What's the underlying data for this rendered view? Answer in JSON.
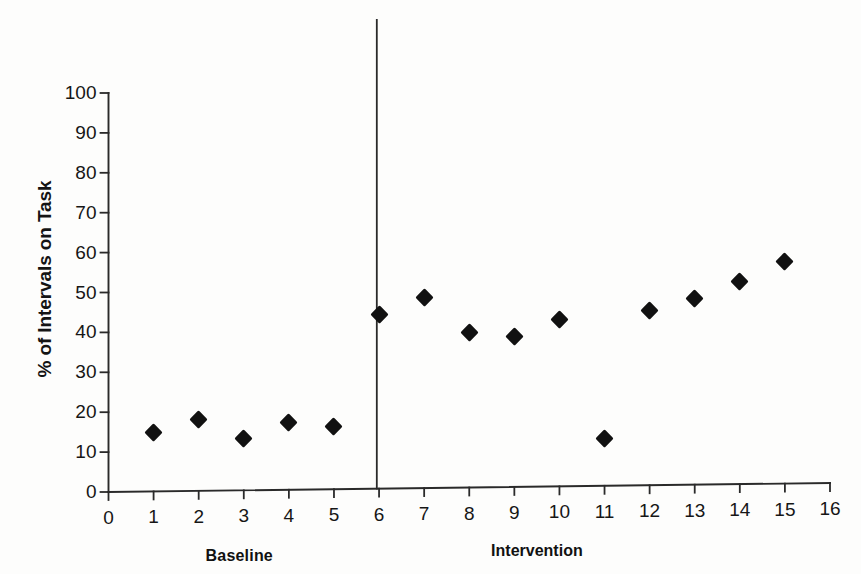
{
  "chart_data": {
    "type": "scatter",
    "title": "",
    "subtitle": "",
    "xlabel": "",
    "ylabel": "% of Intervals on Task",
    "xlim": [
      0,
      16
    ],
    "ylim": [
      0,
      100
    ],
    "xticks": [
      0,
      1,
      2,
      3,
      4,
      5,
      6,
      7,
      8,
      9,
      10,
      11,
      12,
      13,
      14,
      15,
      16
    ],
    "yticks": [
      0,
      10,
      20,
      30,
      40,
      50,
      60,
      70,
      80,
      90,
      100
    ],
    "xtick_labels": [
      "0",
      "1",
      "2",
      "3",
      "4",
      "5",
      "6",
      "7",
      "8",
      "9",
      "10",
      "11",
      "12",
      "13",
      "14",
      "15",
      "16"
    ],
    "ytick_labels": [
      "0",
      "10",
      "20",
      "30",
      "40",
      "50",
      "60",
      "70",
      "80",
      "90",
      "100"
    ],
    "grid": false,
    "legend": false,
    "legend_position": "none",
    "marker": "diamond",
    "marker_color": "#111111",
    "connect_points": false,
    "phase_line_x": 5.95,
    "series": [
      {
        "name": "Baseline",
        "x": [
          1,
          2,
          3,
          4,
          5
        ],
        "values": [
          15.0,
          18.2,
          13.3,
          17.4,
          16.5
        ]
      },
      {
        "name": "Intervention",
        "x": [
          6,
          7,
          8,
          9,
          10,
          11,
          12,
          13,
          14,
          15
        ],
        "values": [
          44.6,
          48.8,
          40.0,
          39.0,
          43.2,
          13.3,
          45.5,
          48.6,
          52.7,
          57.8
        ]
      }
    ],
    "annotations": [
      {
        "text": "Baseline",
        "x": 2.9,
        "placement": "below-axis",
        "bold": true
      },
      {
        "text": "Intervention",
        "x": 9.5,
        "placement": "below-axis",
        "bold": true
      }
    ]
  },
  "axis": {
    "y_title": "% of Intervals on Task"
  },
  "phases": {
    "baseline_label": "Baseline",
    "intervention_label": "Intervention"
  },
  "colors": {
    "marker": "#111111",
    "axis": "#2a2a2a",
    "background": "#fdfdfc"
  }
}
